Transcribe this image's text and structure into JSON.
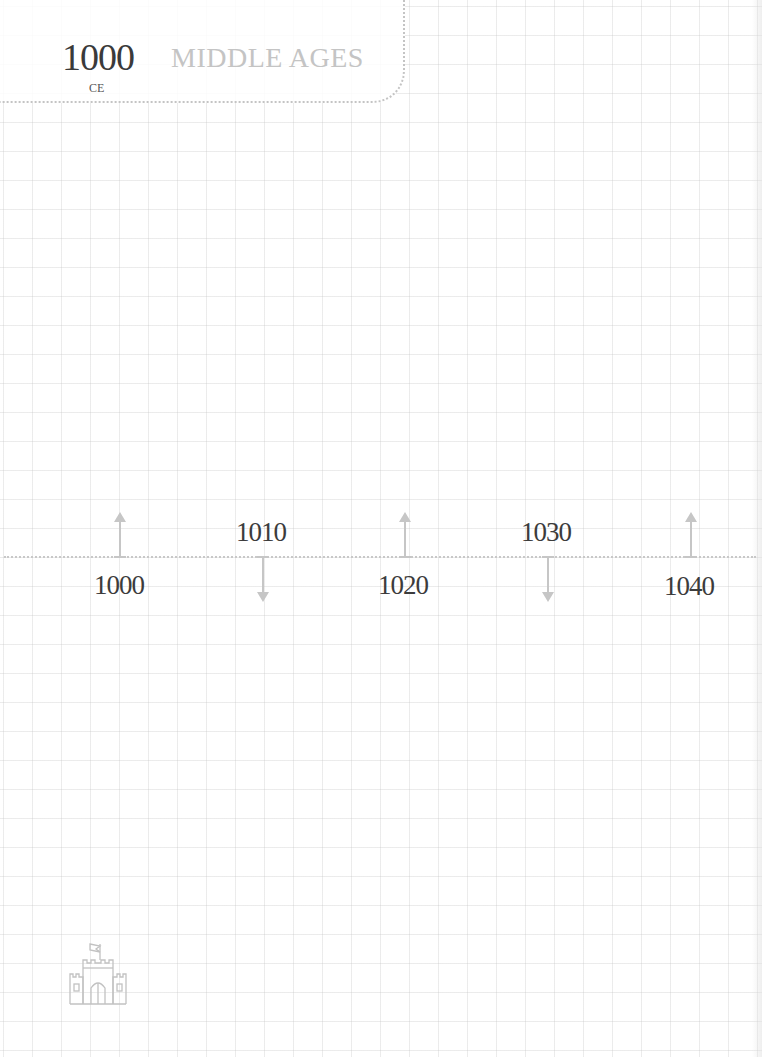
{
  "header": {
    "year": "1000",
    "era_suffix": "CE",
    "title": "MIDDLE AGES"
  },
  "timeline": {
    "ticks": [
      {
        "year": "1000",
        "direction": "up",
        "label_position": "below"
      },
      {
        "year": "1010",
        "direction": "down",
        "label_position": "above"
      },
      {
        "year": "1020",
        "direction": "up",
        "label_position": "below"
      },
      {
        "year": "1030",
        "direction": "down",
        "label_position": "above"
      },
      {
        "year": "1040",
        "direction": "up",
        "label_position": "below"
      }
    ]
  },
  "footer": {
    "icon": "castle-icon"
  },
  "colors": {
    "year_text": "#3a3a3a",
    "title_text": "#c4c4c4",
    "line": "#c8c8c8",
    "arrow": "#c6c6c6",
    "grid": "#e6e6e6"
  }
}
